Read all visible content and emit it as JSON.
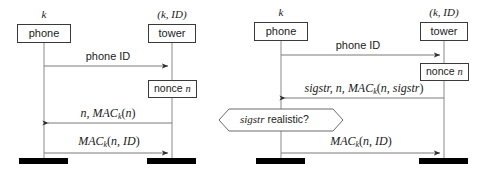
{
  "figure": {
    "colors": {
      "line": "#6e6e6e",
      "stroke": "#3a3a3a",
      "text": "#1a1a1a",
      "terminator": "#000000",
      "background": "#ffffff"
    }
  },
  "left_diagram": {
    "name": "basic-protocol",
    "participants": [
      {
        "id": "phone",
        "label": "phone",
        "key_label": "k",
        "lifeline_x": 44
      },
      {
        "id": "tower",
        "label": "tower",
        "key_label": "(k, ID)",
        "lifeline_x": 172
      }
    ],
    "activations": [
      {
        "id": "nonce",
        "label_prefix": "nonce",
        "label_var": "n",
        "owner": "tower"
      }
    ],
    "messages": [
      {
        "id": "m1",
        "label": "phone ID",
        "style": "plain",
        "direction": "right",
        "from": "phone",
        "to": "tower"
      },
      {
        "id": "m2",
        "label": "n, MAC_k(n)",
        "style": "math",
        "direction": "left",
        "from": "tower",
        "to": "phone"
      },
      {
        "id": "m3",
        "label": "MAC_k(n, ID)",
        "style": "math",
        "direction": "right",
        "from": "phone",
        "to": "tower"
      }
    ]
  },
  "right_diagram": {
    "name": "signal-strength-protocol",
    "participants": [
      {
        "id": "phone",
        "label": "phone",
        "key_label": "k",
        "lifeline_x": 281
      },
      {
        "id": "tower",
        "label": "tower",
        "key_label": "(k, ID)",
        "lifeline_x": 444
      }
    ],
    "activations": [
      {
        "id": "nonce",
        "label_prefix": "nonce",
        "label_var": "n",
        "owner": "tower"
      }
    ],
    "messages": [
      {
        "id": "m1",
        "label": "phone ID",
        "style": "plain",
        "direction": "right",
        "from": "phone",
        "to": "tower"
      },
      {
        "id": "m2",
        "label": "sigstr, n, MAC_k(n, sigstr)",
        "style": "math",
        "direction": "left",
        "from": "tower",
        "to": "phone"
      },
      {
        "id": "m3",
        "label": "MAC_k(n, ID)",
        "style": "math",
        "direction": "right",
        "from": "phone",
        "to": "tower"
      }
    ],
    "decision": {
      "id": "sigstr-check",
      "shape": "hexagon",
      "label_italic": "sigstr",
      "label_rest": " realistic?",
      "owner": "phone"
    }
  }
}
